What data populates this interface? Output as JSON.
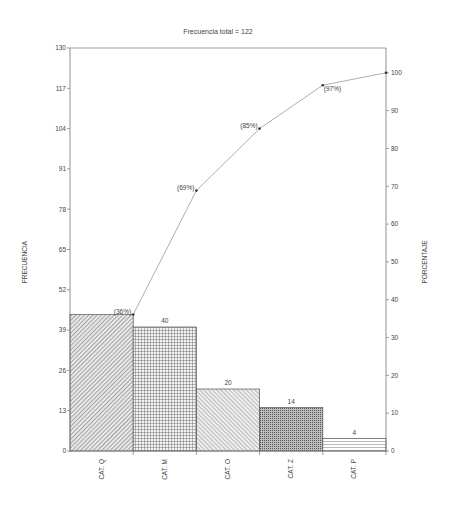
{
  "chart_data": {
    "type": "bar",
    "subtype": "pareto",
    "title": "Frecuencia total  = 122",
    "xlabel": "",
    "ylabel": "FRECUENCIA",
    "y2label": "PORCENTAJE",
    "categories": [
      "CAT. Q",
      "CAT. M",
      "CAT. O",
      "CAT. Z",
      "CAT. P"
    ],
    "series": [
      {
        "name": "Frecuencia",
        "type": "bar",
        "values": [
          44,
          40,
          20,
          14,
          4
        ]
      },
      {
        "name": "Porcentaje acumulado",
        "type": "line",
        "axis": "right",
        "values": [
          36,
          69,
          85,
          97,
          100
        ],
        "labels": [
          "(36%)",
          "(69%)",
          "(85%)",
          "(97%)",
          ""
        ]
      }
    ],
    "bar_labels": [
      "",
      "40",
      "20",
      "14",
      "4"
    ],
    "ylim": [
      0,
      130
    ],
    "yticks": [
      0,
      13,
      26,
      39,
      52,
      65,
      78,
      91,
      104,
      117,
      130
    ],
    "y2lim": [
      0,
      100
    ],
    "y2ticks": [
      0,
      10,
      20,
      30,
      40,
      50,
      60,
      70,
      80,
      90,
      100
    ],
    "grid": false,
    "legend": "none"
  }
}
